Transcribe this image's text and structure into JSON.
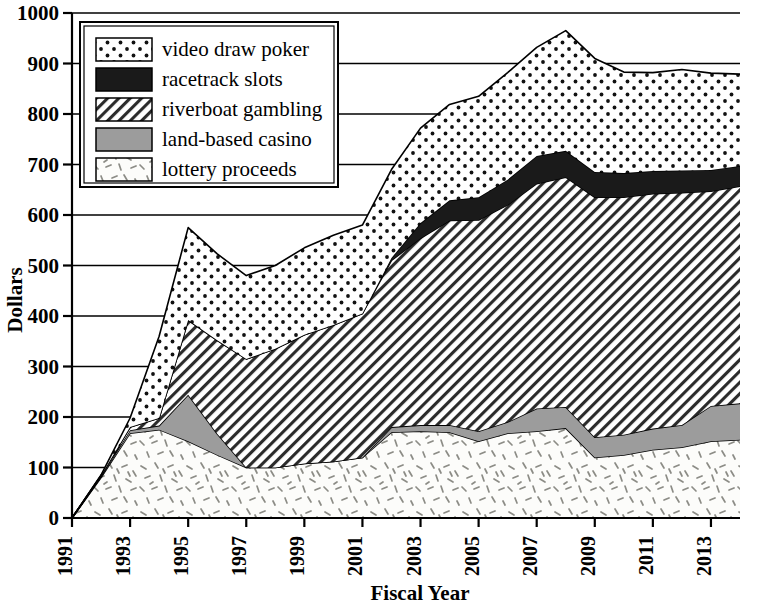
{
  "chart_data": {
    "type": "area",
    "stacked": true,
    "title": "",
    "xlabel": "Fiscal Year",
    "ylabel": "Dollars",
    "xlim": [
      1991,
      2014
    ],
    "ylim": [
      0,
      1000
    ],
    "ytick_step": 100,
    "xtick_step": 2,
    "grid": true,
    "legend_position": "top-left",
    "ytick_labels": [
      "0",
      "100",
      "200",
      "300",
      "400",
      "500",
      "600",
      "700",
      "800",
      "900",
      "1000"
    ],
    "xtick_labels": [
      "1991",
      "1993",
      "1995",
      "1997",
      "1999",
      "2001",
      "2003",
      "2005",
      "2007",
      "2009",
      "2011",
      "2013"
    ],
    "x": [
      1991,
      1992,
      1993,
      1994,
      1995,
      1996,
      1997,
      1998,
      1999,
      2000,
      2001,
      2002,
      2003,
      2004,
      2005,
      2006,
      2007,
      2008,
      2009,
      2010,
      2011,
      2012,
      2013,
      2014
    ],
    "series": [
      {
        "name": "lottery proceeds",
        "fill_pattern": "speckle",
        "fill_color": "#fbfbf8",
        "values": [
          0,
          80,
          168,
          175,
          152,
          125,
          100,
          100,
          108,
          112,
          120,
          170,
          172,
          170,
          152,
          168,
          172,
          178,
          120,
          125,
          135,
          140,
          152,
          155
        ]
      },
      {
        "name": "land-based casino",
        "fill_pattern": "solid-gray",
        "fill_color": "#9c9c9c",
        "values": [
          0,
          2,
          6,
          8,
          92,
          42,
          0,
          0,
          0,
          0,
          0,
          10,
          12,
          14,
          20,
          22,
          45,
          42,
          40,
          40,
          42,
          44,
          70,
          72
        ]
      },
      {
        "name": "riverboat gambling",
        "fill_pattern": "diagonal-hatch",
        "fill_color": "#ffffff",
        "values": [
          0,
          2,
          6,
          15,
          148,
          185,
          215,
          235,
          255,
          270,
          285,
          330,
          370,
          405,
          418,
          430,
          445,
          455,
          475,
          470,
          465,
          460,
          425,
          430
        ]
      },
      {
        "name": "racetrack slots",
        "fill_pattern": "solid-black",
        "fill_color": "#1a1a1a",
        "values": [
          0,
          0,
          0,
          0,
          0,
          0,
          0,
          0,
          0,
          0,
          0,
          5,
          30,
          40,
          45,
          50,
          55,
          52,
          50,
          48,
          45,
          44,
          42,
          40
        ]
      },
      {
        "name": "video draw poker",
        "fill_pattern": "dots",
        "fill_color": "#ffffff",
        "values": [
          0,
          1,
          18,
          162,
          183,
          171,
          165,
          165,
          172,
          178,
          175,
          175,
          188,
          190,
          200,
          212,
          215,
          238,
          225,
          200,
          195,
          200,
          192,
          182
        ]
      }
    ],
    "totals": [
      0,
      85,
      198,
      360,
      575,
      523,
      480,
      500,
      535,
      560,
      580,
      690,
      772,
      819,
      835,
      882,
      932,
      965,
      910,
      883,
      882,
      888,
      881,
      879
    ]
  },
  "legend": {
    "entries": [
      {
        "label": "video draw poker",
        "pattern": "dots"
      },
      {
        "label": "racetrack slots",
        "pattern": "solid-black"
      },
      {
        "label": "riverboat gambling",
        "pattern": "diagonal-hatch"
      },
      {
        "label": "land-based casino",
        "pattern": "solid-gray"
      },
      {
        "label": "lottery proceeds",
        "pattern": "speckle"
      }
    ]
  },
  "colors": {
    "axis": "#000000",
    "grid": "#000000",
    "black_band": "#1a1a1a",
    "gray_band": "#9c9c9c",
    "background": "#ffffff"
  }
}
